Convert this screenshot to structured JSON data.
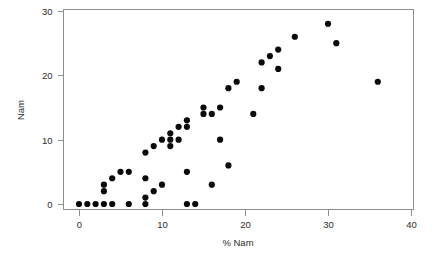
{
  "chart_data": {
    "type": "scatter",
    "title": "",
    "subtitle": "",
    "xlabel": "% Nam",
    "ylabel": "Nam",
    "xlim": [
      -1.5,
      41
    ],
    "ylim": [
      -1.4,
      30.8
    ],
    "xticks": [
      0,
      10,
      20,
      30,
      40
    ],
    "yticks": [
      0,
      10,
      20,
      30
    ],
    "xtick_labels": [
      "0",
      "10",
      "20",
      "30",
      "40"
    ],
    "ytick_labels": [
      "0",
      "10",
      "20",
      "30"
    ],
    "grid": false,
    "legend": false,
    "legend_position": "none",
    "marker": "circle",
    "marker_color": "#0a0a0a",
    "marker_size": 3.1,
    "frame_color": "#8d8d8d",
    "background_color": "#ffffff",
    "series": [
      {
        "name": "Nam",
        "points": [
          [
            0,
            0
          ],
          [
            1,
            0
          ],
          [
            2,
            0
          ],
          [
            3,
            0
          ],
          [
            3,
            2
          ],
          [
            3,
            3
          ],
          [
            4,
            0
          ],
          [
            4,
            4
          ],
          [
            5,
            5
          ],
          [
            6,
            0
          ],
          [
            6,
            5
          ],
          [
            8,
            0
          ],
          [
            8,
            1
          ],
          [
            8,
            4
          ],
          [
            8,
            8
          ],
          [
            9,
            2
          ],
          [
            9,
            9
          ],
          [
            10,
            3
          ],
          [
            10,
            10
          ],
          [
            11,
            9
          ],
          [
            11,
            10
          ],
          [
            11,
            11
          ],
          [
            12,
            10
          ],
          [
            12,
            12
          ],
          [
            13,
            0
          ],
          [
            13,
            5
          ],
          [
            13,
            12
          ],
          [
            13,
            13
          ],
          [
            14,
            0
          ],
          [
            15,
            14
          ],
          [
            15,
            15
          ],
          [
            16,
            3
          ],
          [
            16,
            14
          ],
          [
            17,
            10
          ],
          [
            17,
            15
          ],
          [
            18,
            6
          ],
          [
            18,
            18
          ],
          [
            19,
            19
          ],
          [
            21,
            14
          ],
          [
            22,
            18
          ],
          [
            22,
            22
          ],
          [
            23,
            23
          ],
          [
            24,
            21
          ],
          [
            24,
            24
          ],
          [
            26,
            26
          ],
          [
            30,
            28
          ],
          [
            31,
            25
          ],
          [
            36,
            19
          ]
        ]
      }
    ]
  },
  "axes": {
    "x": {
      "label": "% Nam",
      "ticks": [
        "0",
        "10",
        "20",
        "30",
        "40"
      ]
    },
    "y": {
      "label": "Nam",
      "ticks": [
        "0",
        "10",
        "20",
        "30"
      ]
    }
  }
}
